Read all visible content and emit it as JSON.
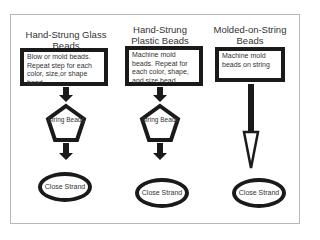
{
  "columns": [
    {
      "title": "Hand-Strung Glass Beads",
      "step1": "Blow or mold beads. Repeat step for each color, size,or shape bead",
      "step2": "String Beads",
      "step3": "Close Strand"
    },
    {
      "title": "Hand-Strung Plastic Beads",
      "step1": "Machine mold beads. Repeat for each color, shape, and size bead",
      "step2": "String Beads",
      "step3": "Close Strand"
    },
    {
      "title": "Molded-on-String Beads",
      "step1": "Machine mold beads on string",
      "step3": "Close Strand"
    }
  ],
  "colors": {
    "stroke": "#1a1a1a",
    "frame": "#b8b8b8"
  }
}
